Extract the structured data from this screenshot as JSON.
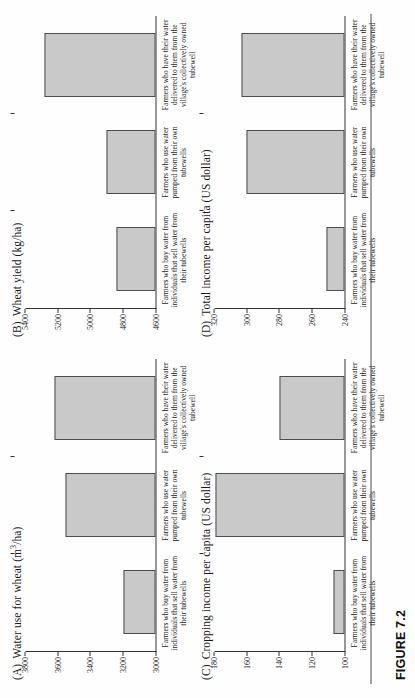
{
  "figure": {
    "caption": "FIGURE 7.2"
  },
  "panels": [
    {
      "label": "(A)",
      "title": "Water use for wheat (m",
      "title_sup": "3",
      "title_tail": "/ha)",
      "title_full": "Water use for wheat (m3/ha)"
    },
    {
      "label": "(B)",
      "title": "Wheat yield (kg/ha)",
      "title_full": "Wheat yield (kg/ha)"
    },
    {
      "label": "(C)",
      "title": "Cropping income per capita (US dollar)",
      "title_full": "Cropping income per capita (US dollar)"
    },
    {
      "label": "(D)",
      "title": "Total income per capita (US dollar)",
      "title_full": "Total income per capita (US dollar)"
    }
  ],
  "categories": [
    "Farmers who buy water from individuals that sell water from their tubewells",
    "Farmers who use water pumped from their own tubewells",
    "Farmers who have their water delivered to them from the village's collectively owned tubewell"
  ],
  "chart_data": [
    {
      "type": "bar",
      "panel": "A",
      "title": "Water use for wheat (m3/ha)",
      "xlabel": "",
      "ylabel": "Water use for wheat (m3/ha)",
      "categories": [
        "Farmers who buy water from individuals that sell water from their tubewells",
        "Farmers who use water pumped from their own tubewells",
        "Farmers who have their water delivered to them from the village's collectively owned tubewell"
      ],
      "values": [
        3200,
        3550,
        3620
      ],
      "ylim": [
        3000,
        3800
      ],
      "yticks": [
        3000,
        3200,
        3400,
        3600,
        3800
      ],
      "grid": false,
      "legend": "none"
    },
    {
      "type": "bar",
      "panel": "B",
      "title": "Wheat yield (kg/ha)",
      "xlabel": "",
      "ylabel": "Wheat yield (kg/ha)",
      "categories": [
        "Farmers who buy water from individuals that sell water from their tubewells",
        "Farmers who use water pumped from their own tubewells",
        "Farmers who have their water delivered to them from the village's collectively owned tubewell"
      ],
      "values": [
        4840,
        4900,
        5280
      ],
      "ylim": [
        4600,
        5400
      ],
      "yticks": [
        4600,
        4800,
        5000,
        5200,
        5400
      ],
      "grid": false,
      "legend": "none"
    },
    {
      "type": "bar",
      "panel": "C",
      "title": "Cropping income per capita (US dollar)",
      "xlabel": "",
      "ylabel": "Cropping income per capita (US dollar)",
      "categories": [
        "Farmers who buy water from individuals that sell water from their tubewells",
        "Farmers who use water pumped from their own tubewells",
        "Farmers who have their water delivered to them from the village's collectively owned tubewell"
      ],
      "values": [
        107,
        179,
        140
      ],
      "ylim": [
        100,
        180
      ],
      "yticks": [
        100,
        120,
        140,
        160,
        180
      ],
      "grid": false,
      "legend": "none"
    },
    {
      "type": "bar",
      "panel": "D",
      "title": "Total income per capita (US dollar)",
      "xlabel": "",
      "ylabel": "Total income per capita (US dollar)",
      "categories": [
        "Farmers who buy water from individuals that sell water from their tubewells",
        "Farmers who use water pumped from their own tubewells",
        "Farmers who have their water delivered to them from the village's collectively owned tubewell"
      ],
      "values": [
        251,
        300,
        303
      ],
      "ylim": [
        240,
        320
      ],
      "yticks": [
        240,
        260,
        280,
        300,
        320
      ],
      "grid": false,
      "legend": "none"
    }
  ],
  "style": {
    "bar_fill": "#c9c9c9",
    "bar_stroke": "#4d4d4d",
    "axis_color": "#333333",
    "text_color": "#1a1a1a",
    "page_background": "#ffffff"
  }
}
